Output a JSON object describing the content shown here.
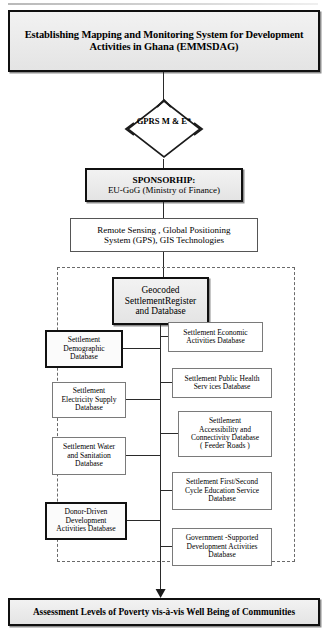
{
  "diagram": {
    "type": "flowchart",
    "title_box": {
      "line1": "Establishing Mapping and Monitoring System for Development",
      "line2": "Activities in Ghana (EMMSDAG)"
    },
    "decision": {
      "line1": "GPRS",
      "line2": "M & E*"
    },
    "sponsor": {
      "line1": "SPONSORHIP:",
      "line2": "EU-GoG (Ministry of Finance)"
    },
    "technologies": {
      "line1": "Remote Sensing , Global Positioning",
      "line2": "System (GPS), GIS Technologies"
    },
    "central_register": {
      "line1": "Geocoded",
      "line2": "SettlementRegister",
      "line3": "and Database"
    },
    "left_databases": [
      {
        "line1": "Settlement",
        "line2": "Demographic",
        "line3": "Database"
      },
      {
        "line1": "Settlement",
        "line2": "Electricity Supply",
        "line3": "Database"
      },
      {
        "line1": "Settlement Water",
        "line2": "and Sanitation",
        "line3": "Database"
      },
      {
        "line1": "Donor-Driven",
        "line2": "Development",
        "line3": "Activities Database"
      }
    ],
    "right_databases": [
      {
        "line1": "Settlement Economic",
        "line2": "Activities Database",
        "line3": "",
        "line4": ""
      },
      {
        "line1": "Settlement Public Health",
        "line2": "Serv ices Database",
        "line3": "",
        "line4": ""
      },
      {
        "line1": "Settlement",
        "line2": "Accessibility  and",
        "line3": "Connectivity Database",
        "line4": "( Feeder Roads )"
      },
      {
        "line1": "Settlement First/Second",
        "line2": "Cycle Education Service",
        "line3": "Database",
        "line4": ""
      },
      {
        "line1": "Government -Supported",
        "line2": "Development Activities",
        "line3": "Database",
        "line4": ""
      }
    ],
    "outcome": {
      "line1": "Assessment Levels of Poverty vis-à-vis Well Being of Communities"
    },
    "colors": {
      "stroke": "#101010",
      "fill_shaded": "#ebebeb",
      "fill_plain": "#ffffff",
      "dashed_border": "#6a6a6a"
    }
  }
}
